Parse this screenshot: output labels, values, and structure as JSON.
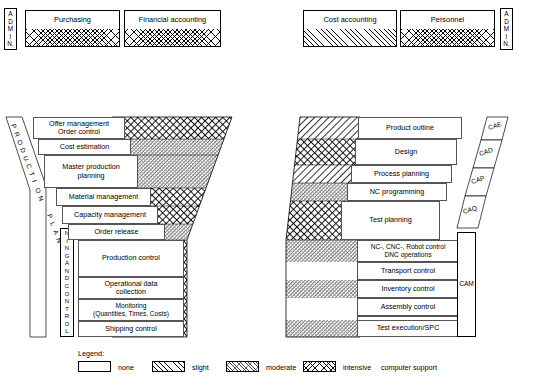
{
  "diagram": {
    "admin_left_label": [
      "A",
      "D",
      "M",
      "I",
      "N."
    ],
    "admin_right_label": [
      "A",
      "D",
      "M",
      "I",
      "N."
    ],
    "top_boxes": [
      {
        "label": "Purchasing",
        "support": "intensive"
      },
      {
        "label": "Financial accounting",
        "support": "intensive"
      },
      {
        "label": "Cost accounting",
        "support": "slight"
      },
      {
        "label": "Personnel",
        "support": "intensive"
      }
    ],
    "left_axis_slanted": [
      "P",
      "R",
      "O",
      "D",
      "U",
      "C",
      "T",
      "I",
      "O",
      "N"
    ],
    "left_axis_slanted2": [
      "P",
      "L",
      "A",
      "N"
    ],
    "left_axis_vertical": [
      "N",
      "I",
      "N",
      "G",
      "",
      "A",
      "N",
      "D",
      "",
      "C",
      "O",
      "N",
      "T",
      "R",
      "O",
      "L"
    ],
    "left_rows": [
      {
        "label": "Offer management\nOrder control",
        "support": "intensive"
      },
      {
        "label": "Cost estimation",
        "support": "moderate"
      },
      {
        "label": "Master production\nplanning",
        "support": "moderate"
      },
      {
        "label": "Material management",
        "support": "intensive"
      },
      {
        "label": "Capacity management",
        "support": "intensive"
      },
      {
        "label": "Order release",
        "support": "moderate"
      },
      {
        "label": "Production control",
        "support": "intensive"
      },
      {
        "label": "Operational data\ncollection",
        "support": "intensive"
      },
      {
        "label": "Monitoring\n(Quantities, Times, Costs)",
        "support": "intensive"
      },
      {
        "label": "Shipping control",
        "support": "intensive"
      }
    ],
    "right_rows": [
      {
        "label": "Product outline",
        "support": "slight"
      },
      {
        "label": "Design",
        "support": "intensive"
      },
      {
        "label": "Process planning",
        "support": "slight"
      },
      {
        "label": "NC programming",
        "support": "moderate"
      },
      {
        "label": "Test planning",
        "support": "intensive"
      },
      {
        "label": "NC-, CNC-, Robot control\nDNC operations",
        "support": "moderate"
      },
      {
        "label": "Transport control",
        "support": "none"
      },
      {
        "label": "Inventory control",
        "support": "moderate"
      },
      {
        "label": "Assembly control",
        "support": "none"
      },
      {
        "label": "Maintenance",
        "support": "none"
      },
      {
        "label": "Test execution/SPC",
        "support": "moderate"
      }
    ],
    "ca_tags": [
      {
        "label": "CAE"
      },
      {
        "label": "CAD"
      },
      {
        "label": "CAP"
      },
      {
        "label": "CAQ"
      },
      {
        "label": "CAM"
      }
    ],
    "legend": {
      "title": "Legend:",
      "items": [
        {
          "label": "none",
          "support": "none"
        },
        {
          "label": "slight",
          "support": "slight"
        },
        {
          "label": "moderate",
          "support": "moderate"
        },
        {
          "label": "intensive",
          "support": "intensive"
        }
      ],
      "suffix": "computer support"
    }
  }
}
